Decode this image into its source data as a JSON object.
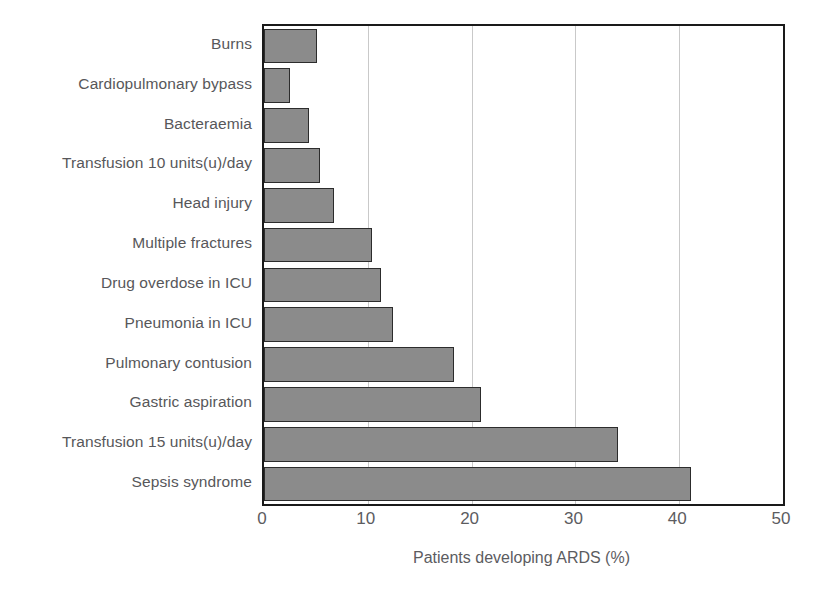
{
  "chart_data": {
    "type": "bar",
    "orientation": "horizontal",
    "title": "",
    "xlabel": "Patients developing ARDS (%)",
    "ylabel": "",
    "xlim": [
      0,
      50
    ],
    "xticks": [
      0,
      10,
      20,
      30,
      40,
      50
    ],
    "grid": "vertical gridlines at 10, 20, 30, 40",
    "legend": "none",
    "bar_color": "#8b8b8b",
    "bar_border_color": "#2c2c2c",
    "categories": [
      "Burns",
      "Cardiopulmonary bypass",
      "Bacteraemia",
      "Transfusion 10 units(u)/day",
      "Head injury",
      "Multiple fractures",
      "Drug overdose in ICU",
      "Pneumonia in ICU",
      "Pulmonary contusion",
      "Gastric aspiration",
      "Transfusion 15 units(u)/day",
      "Sepsis syndrome"
    ],
    "values": [
      5.1,
      2.5,
      4.3,
      5.4,
      6.7,
      10.4,
      11.3,
      12.4,
      18.3,
      20.9,
      34.1,
      41.1
    ]
  },
  "axis": {
    "x_tick_labels": [
      "0",
      "10",
      "20",
      "30",
      "40",
      "50"
    ],
    "x_axis_title": "Patients developing ARDS (%)"
  }
}
